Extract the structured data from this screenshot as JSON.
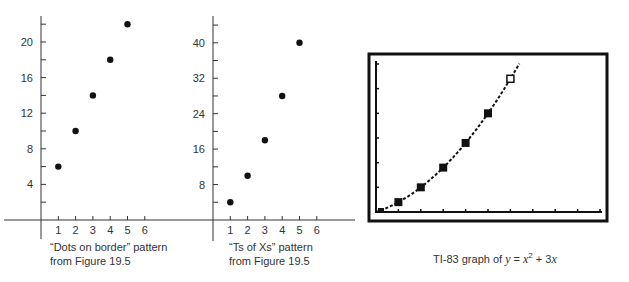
{
  "chart_data": [
    {
      "type": "scatter",
      "title": "",
      "caption_line1": "“Dots on border” pattern",
      "caption_line2": "from Figure 19.5",
      "xlabel": "",
      "ylabel": "",
      "x_ticks": [
        1,
        2,
        3,
        4,
        5,
        6
      ],
      "y_ticks": [
        4,
        8,
        12,
        16,
        20
      ],
      "xlim": [
        0,
        6
      ],
      "ylim": [
        0,
        22
      ],
      "grid": false,
      "points": [
        {
          "x": 1,
          "y": 6
        },
        {
          "x": 2,
          "y": 10
        },
        {
          "x": 3,
          "y": 14
        },
        {
          "x": 4,
          "y": 18
        },
        {
          "x": 5,
          "y": 22
        }
      ]
    },
    {
      "type": "scatter",
      "title": "",
      "caption_line1": "“Ts of Xs” pattern",
      "caption_line2": "from Figure 19.5",
      "xlabel": "",
      "ylabel": "",
      "x_ticks": [
        1,
        2,
        3,
        4,
        5,
        6
      ],
      "y_ticks": [
        8,
        16,
        24,
        32,
        40
      ],
      "xlim": [
        0,
        6
      ],
      "ylim": [
        0,
        44
      ],
      "grid": false,
      "points": [
        {
          "x": 1,
          "y": 4
        },
        {
          "x": 2,
          "y": 10
        },
        {
          "x": 3,
          "y": 18
        },
        {
          "x": 4,
          "y": 28
        },
        {
          "x": 5,
          "y": 40
        }
      ]
    },
    {
      "type": "line",
      "title": "TI-83 graph of y = x² + 3x",
      "caption_prefix": "TI-83 graph of ",
      "caption_y": "y",
      "caption_eq": " = ",
      "caption_x": "x",
      "caption_sup": "2",
      "caption_plus": " + 3",
      "caption_x2": "x",
      "function": "y = x^2 + 3x",
      "xlim": [
        0,
        10
      ],
      "ylim": [
        0,
        60
      ],
      "x_tick_count": 10,
      "y_tick_count": 6,
      "grid": false,
      "marked_points": [
        {
          "x": 0,
          "y": 0,
          "style": "filled"
        },
        {
          "x": 1,
          "y": 4,
          "style": "filled"
        },
        {
          "x": 2,
          "y": 10,
          "style": "filled"
        },
        {
          "x": 3,
          "y": 18,
          "style": "filled"
        },
        {
          "x": 4,
          "y": 28,
          "style": "filled"
        },
        {
          "x": 5,
          "y": 40,
          "style": "filled"
        },
        {
          "x": 6,
          "y": 54,
          "style": "cursor"
        }
      ]
    }
  ]
}
